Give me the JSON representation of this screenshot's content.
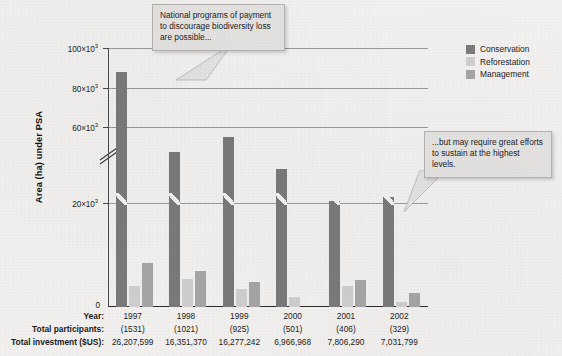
{
  "chart_data": {
    "type": "bar",
    "title": "",
    "xlabel": "",
    "ylabel": "Area (ha) under PSA",
    "ylim": [
      0,
      100000
    ],
    "grid": true,
    "axis_break": {
      "present": true,
      "between": [
        20000,
        60000
      ]
    },
    "legend_position": "top-right",
    "categories": [
      "1997",
      "1998",
      "1999",
      "2000",
      "2001",
      "2002"
    ],
    "ytick_labels": [
      "0",
      "20×10³",
      "60×10³",
      "80×10³",
      "100×10³"
    ],
    "ytick_values": [
      0,
      20000,
      60000,
      80000,
      100000
    ],
    "series": [
      {
        "name": "Conservation",
        "color": "#7a7a7a",
        "values": [
          88000,
          47000,
          55000,
          38000,
          21000,
          23000
        ]
      },
      {
        "name": "Reforestation",
        "color": "#cfcfcf",
        "values": [
          4000,
          5300,
          3500,
          2000,
          4000,
          1000
        ]
      },
      {
        "name": "Management",
        "color": "#a6a6a6",
        "values": [
          8500,
          7000,
          4800,
          0,
          5200,
          2600
        ]
      }
    ],
    "annotations": [
      {
        "id": "callout-left",
        "text": "National programs of payment to discourage biodiversity loss are possible..."
      },
      {
        "id": "callout-right",
        "text": "...but may require great efforts to sustain at the highest levels."
      }
    ]
  },
  "y_axis": {
    "title": "Area (ha) under PSA",
    "ticks": [
      {
        "label": "100×10",
        "exp": "3",
        "value": 100000
      },
      {
        "label": "80×10",
        "exp": "3",
        "value": 80000
      },
      {
        "label": "60×10",
        "exp": "3",
        "value": 60000
      },
      {
        "label": "20×10",
        "exp": "3",
        "value": 20000
      }
    ],
    "zero_label": "0"
  },
  "legend": {
    "items": [
      {
        "label": "Conservation",
        "color": "#7a7a7a"
      },
      {
        "label": "Reforestation",
        "color": "#cfcfcf"
      },
      {
        "label": "Management",
        "color": "#a6a6a6"
      }
    ]
  },
  "callouts": {
    "left": "National programs of payment to discourage biodiversity loss are possible...",
    "right": "...but may require great efforts to sustain at the highest levels."
  },
  "table": {
    "rows": [
      {
        "label": "Year:",
        "values": [
          "1997",
          "1998",
          "1999",
          "2000",
          "2001",
          "2002"
        ]
      },
      {
        "label": "Total participants:",
        "values": [
          "(1531)",
          "(1021)",
          "(925)",
          "(501)",
          "(406)",
          "(329)"
        ]
      },
      {
        "label": "Total investment ($US):",
        "values": [
          "26,207,599",
          "16,351,370",
          "16,277,242",
          "6,966,968",
          "7,806,290",
          "7,031,799"
        ]
      }
    ]
  }
}
